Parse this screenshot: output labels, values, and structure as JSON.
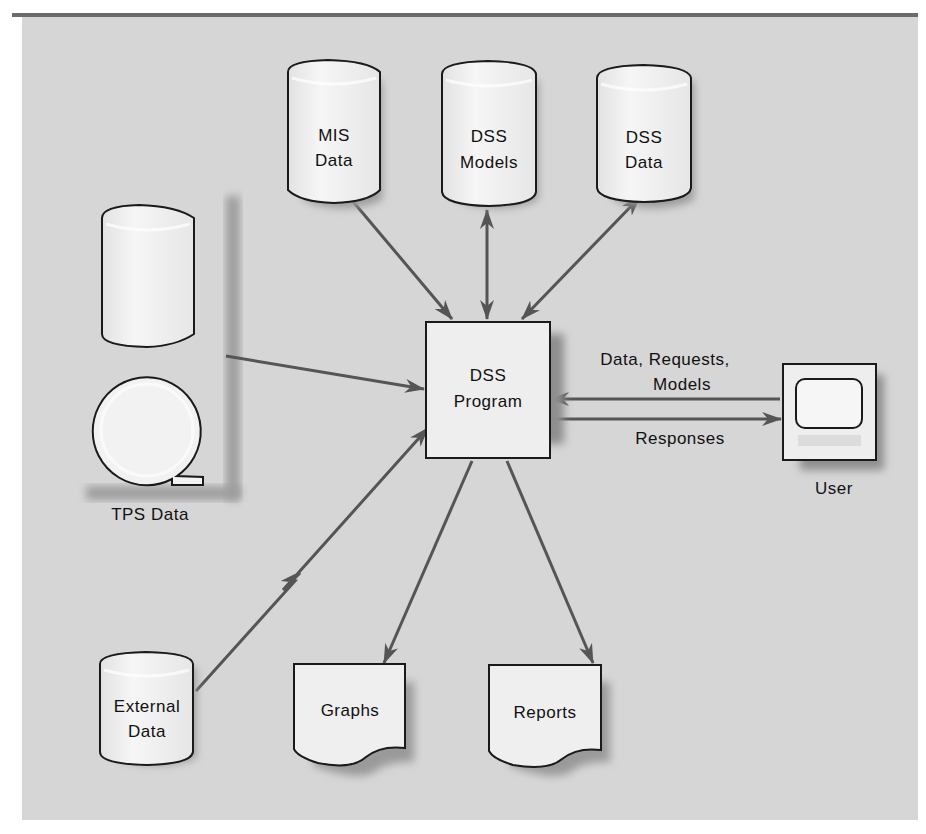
{
  "diagram": {
    "panel": {
      "background": "#d6d6d6",
      "top_border": "#6b6b6b"
    },
    "colors": {
      "arrow": "#555555",
      "shape_fill": "#f1f1f1",
      "shape_stroke": "#1a1a1a",
      "shadow": "#9a9a9a"
    },
    "nodes": {
      "mis_data": {
        "line1": "MIS",
        "line2": "Data",
        "shape": "database-cylinder"
      },
      "dss_models": {
        "line1": "DSS",
        "line2": "Models",
        "shape": "database-cylinder"
      },
      "dss_data": {
        "line1": "DSS",
        "line2": "Data",
        "shape": "database-cylinder"
      },
      "tps_data": {
        "label": "TPS Data",
        "shape": "database-cylinder-and-tape-reel"
      },
      "dss_program": {
        "line1": "DSS",
        "line2": "Program",
        "shape": "rectangle"
      },
      "user": {
        "label": "User",
        "shape": "terminal-monitor"
      },
      "external_data": {
        "line1": "External",
        "line2": "Data",
        "shape": "database-cylinder"
      },
      "graphs": {
        "label": "Graphs",
        "shape": "document"
      },
      "reports": {
        "label": "Reports",
        "shape": "document"
      }
    },
    "edges": [
      {
        "from": "MIS Data",
        "to": "DSS Program",
        "direction": "one-way"
      },
      {
        "from": "DSS Models",
        "to": "DSS Program",
        "direction": "two-way"
      },
      {
        "from": "DSS Data",
        "to": "DSS Program",
        "direction": "two-way"
      },
      {
        "from": "TPS Data",
        "to": "DSS Program",
        "direction": "one-way"
      },
      {
        "from": "External Data",
        "to": "DSS Program",
        "direction": "one-way",
        "style": "lightning"
      },
      {
        "from": "User",
        "to": "DSS Program",
        "direction": "one-way",
        "label_line1": "Data, Requests,",
        "label_line2": "Models"
      },
      {
        "from": "DSS Program",
        "to": "User",
        "direction": "one-way",
        "label": "Responses"
      },
      {
        "from": "DSS Program",
        "to": "Graphs",
        "direction": "one-way"
      },
      {
        "from": "DSS Program",
        "to": "Reports",
        "direction": "one-way"
      }
    ]
  }
}
